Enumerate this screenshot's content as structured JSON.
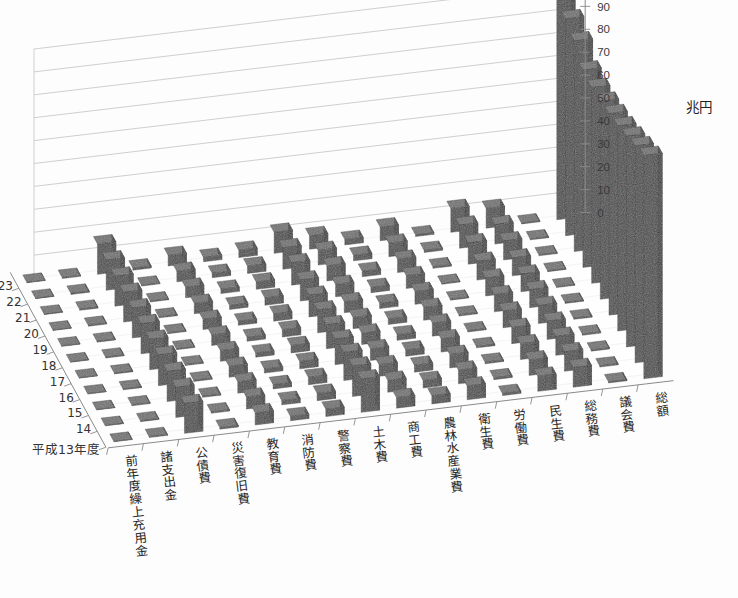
{
  "chart_data": {
    "type": "bar",
    "render": "3d-bar",
    "title": "",
    "unit_label": "兆円",
    "ylabel": "兆円",
    "xlabel": "",
    "zlabel": "平成13年度",
    "ylim": [
      0,
      100
    ],
    "ytick_step": 10,
    "yticks": [
      0,
      10,
      20,
      30,
      40,
      50,
      60,
      70,
      80,
      90,
      100
    ],
    "grid": true,
    "legend": "none",
    "depth_axis_name": "年度",
    "depth_first_label": "平成13年度",
    "depth_categories": [
      "平成13年度",
      "14",
      "15",
      "16",
      "17",
      "18",
      "19",
      "20",
      "21",
      "22",
      "23"
    ],
    "categories": [
      "前年度繰上充用金",
      "諸支出金",
      "公債費",
      "災害復旧費",
      "教育費",
      "消防費",
      "警察費",
      "土木費",
      "商工費",
      "農林水産業費",
      "衛生費",
      "労働費",
      "民生費",
      "総務費",
      "議会費",
      "総額"
    ],
    "series": [
      {
        "name": "平成13年度",
        "values": [
          0.0,
          0.4,
          13.0,
          0.7,
          5.3,
          1.9,
          3.2,
          14.6,
          4.6,
          3.6,
          6.0,
          0.9,
          6.6,
          8.6,
          0.5,
          97.5
        ]
      },
      {
        "name": "14",
        "values": [
          0.0,
          0.4,
          13.2,
          0.6,
          5.2,
          1.9,
          3.2,
          13.3,
          5.2,
          3.3,
          6.0,
          0.8,
          6.8,
          8.5,
          0.5,
          94.8
        ]
      },
      {
        "name": "15",
        "values": [
          0.0,
          0.4,
          13.2,
          0.5,
          5.0,
          1.9,
          3.2,
          12.3,
          5.1,
          3.0,
          5.9,
          0.7,
          6.9,
          8.3,
          0.5,
          92.1
        ]
      },
      {
        "name": "16",
        "values": [
          0.0,
          0.4,
          13.4,
          0.5,
          4.8,
          1.8,
          3.2,
          11.2,
          5.1,
          2.7,
          5.8,
          0.6,
          7.1,
          8.0,
          0.5,
          89.6
        ]
      },
      {
        "name": "17",
        "values": [
          0.0,
          0.4,
          13.3,
          0.4,
          4.7,
          1.8,
          3.2,
          10.5,
          5.0,
          2.5,
          5.7,
          0.5,
          7.3,
          7.9,
          0.5,
          88.0
        ]
      },
      {
        "name": "18",
        "values": [
          0.0,
          0.4,
          13.2,
          0.4,
          4.6,
          1.8,
          3.2,
          10.0,
          4.9,
          2.4,
          5.6,
          0.5,
          7.5,
          7.8,
          0.5,
          86.5
        ]
      },
      {
        "name": "19",
        "values": [
          0.0,
          0.4,
          13.1,
          0.4,
          4.5,
          1.8,
          3.2,
          9.5,
          4.8,
          2.3,
          5.6,
          0.4,
          7.8,
          7.7,
          0.4,
          85.5
        ]
      },
      {
        "name": "20",
        "values": [
          0.0,
          0.4,
          13.0,
          0.4,
          4.5,
          1.8,
          3.2,
          9.2,
          5.4,
          2.3,
          5.6,
          0.4,
          8.2,
          7.8,
          0.4,
          86.2
        ]
      },
      {
        "name": "21",
        "values": [
          0.0,
          0.5,
          13.1,
          0.4,
          4.6,
          1.9,
          3.2,
          9.8,
          6.6,
          2.4,
          5.8,
          0.7,
          9.3,
          8.3,
          0.4,
          92.0
        ]
      },
      {
        "name": "22",
        "values": [
          0.0,
          0.5,
          13.2,
          0.4,
          4.6,
          1.9,
          3.2,
          9.4,
          6.4,
          2.4,
          5.9,
          0.9,
          10.1,
          8.5,
          0.4,
          94.7
        ]
      },
      {
        "name": "23",
        "values": [
          0.0,
          0.5,
          13.3,
          0.9,
          4.6,
          1.9,
          3.2,
          9.2,
          5.9,
          2.4,
          6.0,
          0.8,
          10.4,
          8.6,
          0.4,
          96.9
        ]
      }
    ]
  },
  "axes": {
    "y": {
      "unit": "兆円",
      "ticks": [
        "100",
        "90",
        "80",
        "70",
        "60",
        "50",
        "40",
        "30",
        "20",
        "10",
        "0"
      ]
    },
    "depth": {
      "ticks": [
        "23",
        "22",
        "21",
        "20",
        "19",
        "18",
        "17",
        "16",
        "15",
        "14"
      ],
      "origin_label": "平成13年度"
    },
    "category": {
      "labels": [
        "前年度繰上充用金",
        "諸支出金",
        "公債費",
        "災害復旧費",
        "教育費",
        "消防費",
        "警察費",
        "土木費",
        "商工費",
        "農林水産業費",
        "衛生費",
        "労働費",
        "民生費",
        "総務費",
        "議会費",
        "総額"
      ]
    }
  },
  "style": {
    "bar_top": "#6f6f6f",
    "bar_front": "#4a4a4a",
    "bar_side": "#3a3a3a",
    "grid_color": "#c9c9c9",
    "axis_color": "#8a8a8a",
    "background": "#fdfdfd"
  }
}
